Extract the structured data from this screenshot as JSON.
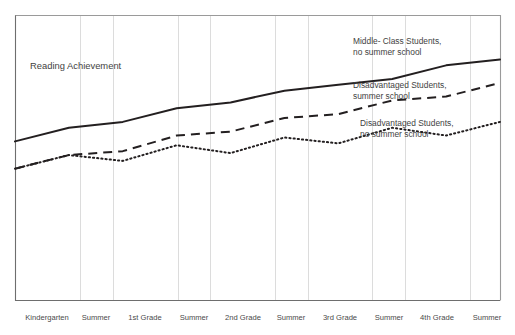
{
  "chart_data": {
    "type": "line",
    "title": "Reading Achievement",
    "xlabel": "",
    "ylabel": "Reading Achievement",
    "grid": true,
    "legend_position": "inline-annotations",
    "categories": [
      "Kindergarten",
      "Summer",
      "1st Grade",
      "Summer",
      "2nd Grade",
      "Summer",
      "3rd Grade",
      "Summer",
      "4th Grade",
      "Summer"
    ],
    "x": [
      0,
      1,
      2,
      3,
      4,
      5,
      6,
      7,
      8,
      9
    ],
    "axis_ranges": {
      "ylim": [
        0,
        100
      ],
      "y_ticks_shown": false,
      "x_ticks_shown": true
    },
    "series": [
      {
        "name": "Middle-Class Students, no summer school",
        "style": "solid",
        "color": "#231f20",
        "values": [
          48,
          55,
          58,
          65,
          68,
          74,
          77,
          80,
          87,
          90
        ]
      },
      {
        "name": "Disadvantaged Students, summer school",
        "style": "dashed",
        "color": "#231f20",
        "values": [
          34,
          41,
          43,
          51,
          53,
          60,
          62,
          69,
          71,
          78
        ]
      },
      {
        "name": "Disadvantaged Students, no summer school",
        "style": "dotted",
        "color": "#231f20",
        "values": [
          34,
          41,
          38,
          46,
          42,
          50,
          47,
          55,
          51,
          58
        ]
      }
    ],
    "annotations": [
      {
        "id": "annotation-middle-class",
        "lines": [
          "Middle- Class Students,",
          "no summer school"
        ],
        "x_px": 353,
        "y_px": 44
      },
      {
        "id": "annotation-disadvantaged-summer-school",
        "lines": [
          "Disadvantaged Students,",
          "summer school"
        ],
        "x_px": 353,
        "y_px": 88
      },
      {
        "id": "annotation-disadvantaged-no-summer-school",
        "lines": [
          "Disadvantaged Students,",
          "no summer school"
        ],
        "x_px": 360,
        "y_px": 126
      }
    ],
    "tick_positions_px": [
      47,
      113,
      178,
      243,
      308,
      372,
      437,
      500
    ],
    "gridline_positions_px": [
      80,
      113,
      178,
      210,
      275,
      308,
      372,
      405,
      470
    ]
  },
  "axis": {
    "tick_labels": [
      {
        "label": "Kindergarten",
        "x_px": 47
      },
      {
        "label": "Summer",
        "x_px": 96
      },
      {
        "label": "1st Grade",
        "x_px": 145
      },
      {
        "label": "Summer",
        "x_px": 194
      },
      {
        "label": "2nd Grade",
        "x_px": 243
      },
      {
        "label": "Summer",
        "x_px": 291
      },
      {
        "label": "3rd Grade",
        "x_px": 340
      },
      {
        "label": "Summer",
        "x_px": 389
      },
      {
        "label": "4th Grade",
        "x_px": 437
      },
      {
        "label": "Summer",
        "x_px": 487
      }
    ]
  },
  "colors": {
    "ink": "#231f20",
    "axis": "#6e6e6e",
    "grid": "#d8d8d8",
    "text": "#3f3f3f",
    "background": "#ffffff"
  }
}
